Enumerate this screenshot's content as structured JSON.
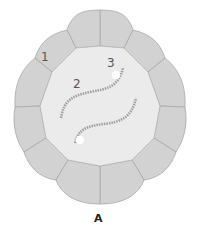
{
  "diagram": {
    "caption": "A",
    "labels": [
      {
        "id": "1",
        "text": "1"
      },
      {
        "id": "2",
        "text": "2"
      },
      {
        "id": "3",
        "text": "3"
      }
    ],
    "colors": {
      "cell_fill": "#d2d2d2",
      "cell_stroke": "#a8a8a8",
      "lumen_fill": "#ebebeb",
      "strand": "#a0a0a0",
      "dot": "#ffffff"
    }
  }
}
